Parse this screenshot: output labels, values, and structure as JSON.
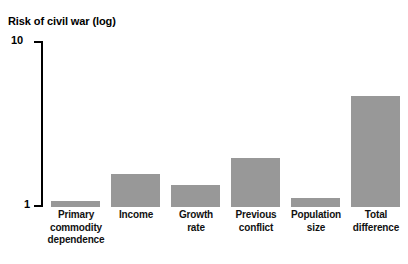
{
  "chart_data": {
    "type": "bar",
    "title": "Risk of civil war (log)",
    "xlabel": "",
    "ylabel": "Risk of civil war (log)",
    "scale": "log",
    "ylim": [
      1,
      10
    ],
    "ytick_labels": [
      "10",
      "1"
    ],
    "grid": false,
    "legend": false,
    "bar_color": "#989898",
    "axis_color": "#000000",
    "categories": [
      "Primary commodity dependence",
      "Income",
      "Growth rate",
      "Previous conflict",
      "Population size",
      "Total difference"
    ],
    "category_lines": [
      [
        "Primary",
        "commodity",
        "dependence"
      ],
      [
        "Income"
      ],
      [
        "Growth",
        "rate"
      ],
      [
        "Previous",
        "conflict"
      ],
      [
        "Population",
        "size"
      ],
      [
        "Total",
        "difference"
      ]
    ],
    "values": [
      1.09,
      1.58,
      1.36,
      1.98,
      1.13,
      4.64
    ]
  }
}
